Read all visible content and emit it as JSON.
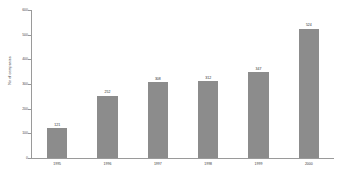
{
  "chart_data": {
    "type": "bar",
    "title": "",
    "xlabel": "",
    "ylabel": "No of companies",
    "categories": [
      "1995",
      "1996",
      "1997",
      "1998",
      "1999",
      "2000"
    ],
    "values": [
      121,
      252,
      308,
      312,
      347,
      524
    ],
    "value_labels": [
      "121",
      "252",
      "308",
      "312",
      "347",
      "524"
    ],
    "ylim": [
      0,
      600
    ],
    "yticks": [
      0,
      100,
      200,
      300,
      400,
      500,
      600
    ],
    "ytick_labels": [
      "0",
      "100",
      "200",
      "300",
      "400",
      "500",
      "600"
    ],
    "grid": false,
    "legend": false,
    "bar_color": "#8c8c8c",
    "axis_color": "#9a9a9a",
    "text_color": "#3a3a3a",
    "background": "#ffffff"
  }
}
